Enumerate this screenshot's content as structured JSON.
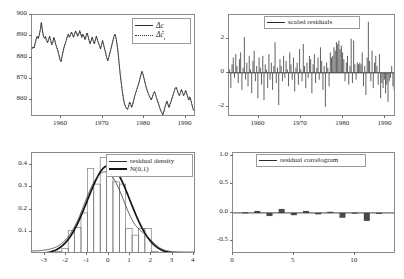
{
  "figure": {
    "name": "model-diagnostics-2x2",
    "panel_count": 4
  },
  "chart_data": [
    {
      "id": "actual-vs-fitted",
      "type": "line",
      "title": "",
      "xlabel": "",
      "ylabel": "",
      "xlim": [
        1953.0,
        1992.5
      ],
      "ylim": [
        852.0,
        900.0
      ],
      "xticks": [
        "1960",
        "1970",
        "1980",
        "1990"
      ],
      "xtick_values": [
        1960,
        1970,
        1980,
        1990
      ],
      "yticks": [
        "860",
        "870",
        "880",
        "890",
        "900"
      ],
      "ytick_values": [
        860,
        870,
        880,
        890,
        900
      ],
      "grid": false,
      "legend_position": "top-right",
      "series": [
        {
          "name": "Δc",
          "style": "solid",
          "x": [
            1953.0,
            1953.25,
            1953.5,
            1953.75,
            1954.0,
            1954.25,
            1954.5,
            1954.75,
            1955.0,
            1955.25,
            1955.5,
            1955.75,
            1956.0,
            1956.25,
            1956.5,
            1956.75,
            1957.0,
            1957.25,
            1957.5,
            1957.75,
            1958.0,
            1958.25,
            1958.5,
            1958.75,
            1959.0,
            1959.25,
            1959.5,
            1959.75,
            1960.0,
            1960.25,
            1960.5,
            1960.75,
            1961.0,
            1961.25,
            1961.5,
            1961.75,
            1962.0,
            1962.25,
            1962.5,
            1962.75,
            1963.0,
            1963.25,
            1963.5,
            1963.75,
            1964.0,
            1964.25,
            1964.5,
            1964.75,
            1965.0,
            1965.25,
            1965.5,
            1965.75,
            1966.0,
            1966.25,
            1966.5,
            1966.75,
            1967.0,
            1967.25,
            1967.5,
            1967.75,
            1968.0,
            1968.25,
            1968.5,
            1968.75,
            1969.0,
            1969.25,
            1969.5,
            1969.75,
            1970.0,
            1970.25,
            1970.5,
            1970.75,
            1971.0,
            1971.25,
            1971.5,
            1971.75,
            1972.0,
            1972.25,
            1972.5,
            1972.75,
            1973.0,
            1973.25,
            1973.5,
            1973.75,
            1974.0,
            1974.25,
            1974.5,
            1974.75,
            1975.0,
            1975.25,
            1975.5,
            1975.75,
            1976.0,
            1976.25,
            1976.5,
            1976.75,
            1977.0,
            1977.25,
            1977.5,
            1977.75,
            1978.0,
            1978.25,
            1978.5,
            1978.75,
            1979.0,
            1979.25,
            1979.5,
            1979.75,
            1980.0,
            1980.25,
            1980.5,
            1980.75,
            1981.0,
            1981.25,
            1981.5,
            1981.75,
            1982.0,
            1982.25,
            1982.5,
            1982.75,
            1983.0,
            1983.25,
            1983.5,
            1983.75,
            1984.0,
            1984.25,
            1984.5,
            1984.75,
            1985.0,
            1985.25,
            1985.5,
            1985.75,
            1986.0,
            1986.25,
            1986.5,
            1986.75,
            1987.0,
            1987.25,
            1987.5,
            1987.75,
            1988.0,
            1988.25,
            1988.5,
            1988.75,
            1989.0,
            1989.25,
            1989.5,
            1989.75,
            1990.0,
            1990.25,
            1990.5,
            1990.75,
            1991.0,
            1991.25,
            1991.5,
            1991.75,
            1992.0,
            1992.25
          ],
          "y": [
            884.0,
            885.0,
            884.5,
            886.5,
            888.5,
            890.0,
            889.0,
            890.5,
            893.0,
            896.5,
            893.0,
            890.0,
            889.0,
            890.0,
            888.0,
            887.0,
            888.5,
            890.0,
            888.0,
            886.0,
            887.0,
            889.5,
            888.0,
            886.0,
            884.5,
            883.0,
            881.0,
            879.0,
            878.0,
            880.5,
            883.0,
            885.0,
            886.5,
            888.0,
            890.0,
            891.0,
            889.5,
            890.5,
            892.0,
            891.0,
            889.5,
            891.0,
            892.5,
            891.5,
            890.0,
            891.0,
            892.5,
            891.0,
            889.5,
            891.0,
            890.0,
            888.5,
            890.0,
            891.5,
            890.0,
            888.0,
            886.5,
            888.0,
            889.5,
            888.0,
            886.5,
            888.0,
            890.0,
            888.5,
            887.0,
            885.5,
            884.0,
            886.0,
            888.0,
            886.0,
            884.0,
            882.0,
            880.0,
            878.5,
            880.0,
            882.0,
            884.0,
            886.0,
            888.0,
            890.0,
            891.0,
            889.0,
            886.0,
            882.0,
            877.0,
            872.0,
            868.0,
            864.0,
            861.0,
            858.5,
            857.0,
            856.0,
            855.5,
            857.0,
            859.0,
            858.0,
            856.5,
            858.0,
            860.0,
            862.0,
            863.5,
            865.0,
            866.5,
            868.0,
            870.0,
            872.0,
            873.5,
            872.0,
            870.0,
            868.0,
            866.0,
            864.5,
            863.0,
            862.0,
            861.0,
            860.0,
            861.5,
            863.0,
            864.0,
            862.5,
            861.0,
            859.5,
            858.0,
            856.5,
            855.0,
            854.0,
            853.0,
            854.5,
            856.5,
            858.0,
            859.5,
            858.0,
            856.5,
            858.0,
            859.5,
            861.0,
            862.5,
            864.0,
            865.5,
            866.0,
            864.5,
            863.0,
            862.0,
            863.5,
            865.0,
            863.5,
            862.0,
            863.0,
            864.5,
            863.0,
            861.5,
            860.0,
            861.5,
            860.0,
            858.0,
            856.0,
            855.0
          ]
        },
        {
          "name": "Δĉ",
          "style": "dotted",
          "note": "fitted values, nearly coincident with actual"
        }
      ],
      "legend": [
        {
          "label": "Δc",
          "style": "solid"
        },
        {
          "label": "Δĉ",
          "sub": "t",
          "style": "dotted"
        }
      ]
    },
    {
      "id": "scaled-residuals",
      "type": "bar",
      "title": "",
      "xlabel": "",
      "ylabel": "",
      "xlim": [
        1953.0,
        1992.5
      ],
      "ylim": [
        -2.6,
        3.4
      ],
      "xticks": [
        "1960",
        "1970",
        "1980",
        "1990"
      ],
      "xtick_values": [
        1960,
        1970,
        1980,
        1990
      ],
      "yticks": [
        "-2",
        "0",
        "2"
      ],
      "ytick_values": [
        -2,
        0,
        2
      ],
      "grid": false,
      "legend_position": "top-center",
      "legend": [
        {
          "label": "scaled residuals",
          "style": "solid"
        }
      ],
      "values": [
        0.2,
        -0.9,
        0.5,
        0.9,
        -0.3,
        1.1,
        0.4,
        -0.6,
        0.8,
        1.2,
        -1.0,
        0.3,
        2.1,
        -0.4,
        0.6,
        -0.8,
        1.0,
        0.2,
        -1.2,
        0.7,
        1.3,
        -0.5,
        0.4,
        -1.5,
        0.9,
        0.3,
        -0.7,
        1.0,
        -1.6,
        0.5,
        0.2,
        -0.9,
        1.1,
        -0.4,
        0.6,
        -1.0,
        0.4,
        1.8,
        -0.6,
        0.3,
        -1.9,
        0.8,
        0.4,
        -0.5,
        1.0,
        -0.3,
        0.7,
        0.2,
        -0.8,
        1.2,
        0.5,
        -0.4,
        0.9,
        -1.1,
        0.3,
        0.6,
        -0.7,
        1.4,
        0.2,
        -0.5,
        1.7,
        0.4,
        -0.9,
        0.6,
        -0.3,
        1.0,
        0.8,
        -1.2,
        0.5,
        1.1,
        -0.6,
        0.3,
        0.9,
        -0.4,
        1.5,
        0.7,
        -1.0,
        0.4,
        -2.0,
        0.6,
        0.3,
        -0.8,
        1.2,
        0.9,
        1.0,
        1.5,
        1.3,
        1.8,
        1.7,
        1.9,
        1.4,
        1.6,
        1.2,
        0.8,
        -0.5,
        0.6,
        1.0,
        -0.7,
        0.4,
        2.0,
        -0.6,
        1.9,
        0.5,
        -0.4,
        0.6,
        0.5,
        0.6,
        0.5,
        1.2,
        -0.8,
        0.4,
        -1.3,
        0.9,
        3.0,
        0.7,
        -0.5,
        1.3,
        -0.9,
        0.6,
        1.0,
        0.4,
        -0.7,
        1.1,
        -1.5,
        -0.6,
        -0.9,
        -0.4,
        -1.2,
        -0.7,
        -1.7,
        -0.5,
        -0.3,
        0.4,
        -0.8,
        -1.0,
        -0.6
      ]
    },
    {
      "id": "residual-density",
      "type": "bar",
      "title": "",
      "xlabel": "",
      "ylabel": "",
      "xlim": [
        -3.6,
        4.1
      ],
      "ylim": [
        0.0,
        0.455
      ],
      "xticks": [
        "-3",
        "-2",
        "-1",
        "0",
        "1",
        "2",
        "3",
        "4"
      ],
      "xtick_values": [
        -3,
        -2,
        -1,
        0,
        1,
        2,
        3,
        4
      ],
      "yticks": [
        "0.1",
        "0.2",
        "0.3",
        "0.4"
      ],
      "ytick_values": [
        0.1,
        0.2,
        0.3,
        0.4
      ],
      "grid": false,
      "legend_position": "top-right",
      "legend": [
        {
          "label": "residual density",
          "style": "solid"
        },
        {
          "label": "N(0,1)",
          "style": "thick"
        }
      ],
      "bin_edges": [
        -2.5,
        -2.2,
        -1.9,
        -1.6,
        -1.3,
        -1.0,
        -0.7,
        -0.4,
        -0.1,
        0.2,
        0.5,
        0.8,
        1.1,
        1.4,
        1.7,
        2.0,
        2.3,
        2.6,
        2.9,
        3.2
      ],
      "bin_width": 0.3,
      "values": [
        0.012,
        0.025,
        0.105,
        0.12,
        0.185,
        0.385,
        0.315,
        0.435,
        0.395,
        0.325,
        0.315,
        0.115,
        0.085,
        0.115,
        0.115,
        0.012,
        0.008,
        0.012,
        0.008
      ],
      "overlay": {
        "name": "N(0,1)",
        "mean": 0,
        "sd": 1,
        "peak": 0.3989
      }
    },
    {
      "id": "residual-correlogram",
      "type": "bar",
      "title": "",
      "xlabel": "",
      "ylabel": "",
      "xlim": [
        0,
        13.4
      ],
      "ylim": [
        -0.72,
        1.05
      ],
      "xticks": [
        "0",
        "5",
        "10"
      ],
      "xtick_values": [
        0,
        5,
        10
      ],
      "yticks": [
        "1.0",
        "0.5",
        "0.0",
        "-0.5"
      ],
      "ytick_values": [
        1.0,
        0.5,
        0.0,
        -0.5
      ],
      "grid": false,
      "legend_position": "top-center",
      "legend": [
        {
          "label": "residual correlogram",
          "style": "solid"
        }
      ],
      "lags": [
        1,
        2,
        3,
        4,
        5,
        6,
        7,
        8,
        9,
        10,
        11,
        12
      ],
      "values": [
        0.01,
        0.035,
        -0.055,
        0.07,
        -0.04,
        0.035,
        -0.025,
        0.02,
        -0.085,
        0.005,
        -0.14,
        -0.01
      ]
    }
  ],
  "colors": {
    "line": "#2b2b2b",
    "axis": "#8a8a8a",
    "bar_fill": "#4a4a4a",
    "normal_curve": "#141414",
    "background": "#ffffff"
  }
}
